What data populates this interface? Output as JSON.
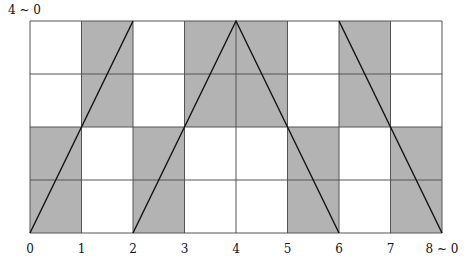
{
  "diagram": {
    "top_left_label": "4 ~ 0",
    "x_labels": [
      "0",
      "1",
      "2",
      "3",
      "4",
      "5",
      "6",
      "7",
      "8 ~ 0"
    ],
    "columns": 8,
    "rows": 4,
    "shade_color": "#b3b3b3",
    "line_color": "#111111",
    "grid_color": "#555555",
    "shaded_cells_by_column": [
      [
        2,
        3
      ],
      [
        0,
        1
      ],
      [
        2,
        3
      ],
      [
        0,
        1
      ],
      [
        0,
        1
      ],
      [
        2,
        3
      ],
      [
        0,
        1
      ],
      [
        2,
        3
      ]
    ],
    "polylines": [
      [
        [
          0,
          0
        ],
        [
          2,
          4
        ]
      ],
      [
        [
          2,
          0
        ],
        [
          4,
          4
        ],
        [
          6,
          0
        ]
      ],
      [
        [
          6,
          4
        ],
        [
          8,
          0
        ]
      ]
    ]
  }
}
